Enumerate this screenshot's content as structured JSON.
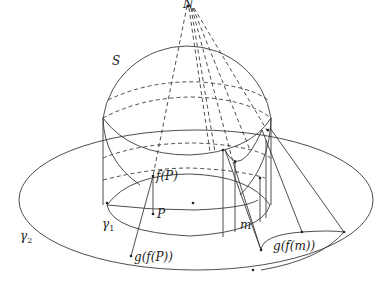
{
  "diagram": {
    "title": "",
    "labels": {
      "north_pole": "N",
      "sphere": "S",
      "inner_curve": "γ",
      "inner_curve_sub": "1",
      "outer_curve": "γ",
      "outer_curve_sub": "2",
      "point_p": "P",
      "f_of_p": "f(P)",
      "g_of_f_of_p": "g(f(P))",
      "region_m": "m",
      "g_of_f_of_m": "g(f(m))"
    },
    "colors": {
      "stroke": "#333333",
      "background": "#ffffff"
    }
  }
}
